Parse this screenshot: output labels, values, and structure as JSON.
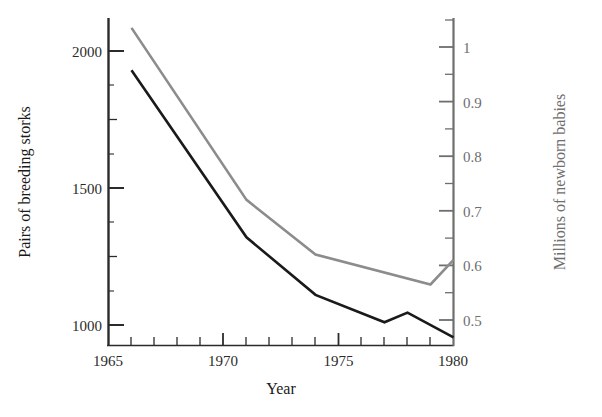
{
  "chart_data": {
    "type": "line",
    "title": "",
    "xlabel": "Year",
    "ylabel": "Pairs of breeding storks",
    "ylabel_right": "Millions of newborn babies",
    "xlim": [
      1965,
      1980
    ],
    "ylim": [
      920,
      2100
    ],
    "ylim_right": [
      0.46,
      1.055
    ],
    "grid": false,
    "legend": "none",
    "x_ticks_major": [
      1965,
      1970,
      1975,
      1980
    ],
    "x_tick_labels": [
      "1965",
      "1970",
      "1975",
      "1980"
    ],
    "x_ticks_minor": [
      1966,
      1967,
      1968,
      1969,
      1971,
      1972,
      1973,
      1974,
      1976,
      1977,
      1978,
      1979
    ],
    "y_ticks_left": [
      1000,
      1500,
      2000
    ],
    "y_tick_labels_left": [
      "1000",
      "1500",
      "2000"
    ],
    "y_ticks_right": [
      0.5,
      0.6,
      0.7,
      0.8,
      0.9,
      1.0
    ],
    "y_tick_labels_right": [
      "0.5",
      "0.6",
      "0.7",
      "0.8",
      "0.9",
      "1"
    ],
    "y_ticks_right_minor": [
      0.55,
      0.65,
      0.75,
      0.85,
      0.95,
      1.03
    ],
    "series": [
      {
        "name": "Pairs of breeding storks",
        "axis": "left",
        "color": "#1a1a1a",
        "x": [
          1966,
          1971,
          1974,
          1977,
          1978,
          1980
        ],
        "values": [
          1930,
          1320,
          1110,
          1010,
          1045,
          955
        ]
      },
      {
        "name": "Millions of newborn babies",
        "axis": "right",
        "color": "#8c8c8c",
        "x": [
          1966,
          1971,
          1974,
          1979,
          1980
        ],
        "values": [
          1.035,
          0.72,
          0.62,
          0.565,
          0.61
        ]
      }
    ]
  }
}
